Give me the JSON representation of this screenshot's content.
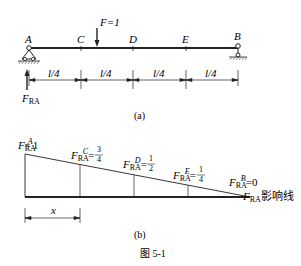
{
  "figure_a": {
    "points": [
      "A",
      "C",
      "D",
      "E",
      "B"
    ],
    "load_label": "F=1",
    "segment_label": "l/4",
    "reaction": {
      "symbol": "F",
      "subscript": "RA"
    },
    "caption": "(a)"
  },
  "figure_b": {
    "values": [
      {
        "point": "A",
        "value": "1"
      },
      {
        "point": "C",
        "num": "3",
        "den": "4"
      },
      {
        "point": "D",
        "num": "1",
        "den": "2"
      },
      {
        "point": "E",
        "num": "1",
        "den": "4"
      },
      {
        "point": "B",
        "value": "0"
      }
    ],
    "symbol": "F",
    "subscript": "RA",
    "line_suffix": "影响线",
    "x_label": "x",
    "caption": "(b)"
  },
  "figure_caption": "图 5-1"
}
